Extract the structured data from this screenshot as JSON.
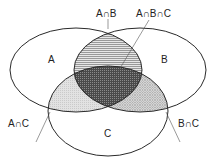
{
  "diagram": {
    "type": "venn",
    "sets": [
      {
        "id": "A",
        "label": "A"
      },
      {
        "id": "B",
        "label": "B"
      },
      {
        "id": "C",
        "label": "C"
      }
    ],
    "region_labels": {
      "a_and_b": "A∩B",
      "a_and_b_and_c": "A∩B∩C",
      "a_and_c": "A∩C",
      "b_and_c": "B∩C"
    },
    "shading": {
      "a_and_b": "horizontal-lines",
      "a_and_c": "light-stipple",
      "b_and_c": "cross-hatch",
      "a_and_b_and_c": "dark-dense"
    },
    "colors": {
      "stroke": "#2a2a2a",
      "text": "#222222",
      "background": "#ffffff"
    }
  }
}
